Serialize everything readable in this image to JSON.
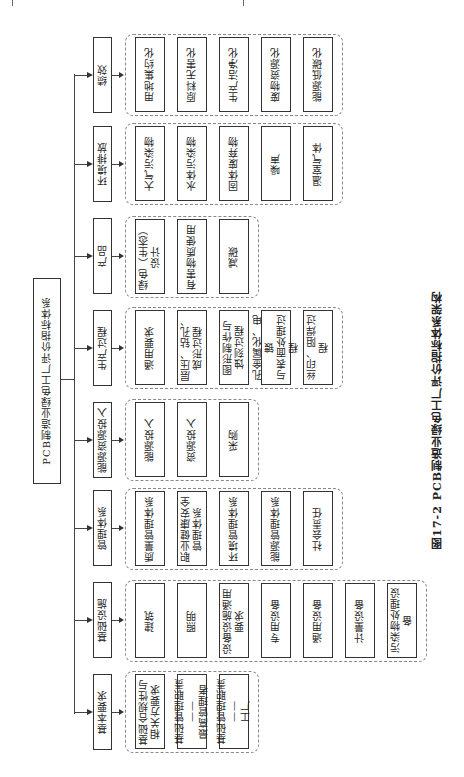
{
  "root": {
    "label": "PCB制造业绿色工厂评价指标体系"
  },
  "caption": "图17-2  PCB制造业绿色工厂评价指标体系架构",
  "categories": [
    {
      "label": "绩效",
      "items": [
        "用地集约化",
        "原料无害化",
        "生产洁净化",
        "废物资源化",
        "能源低碳化"
      ]
    },
    {
      "label": "环境排放",
      "items": [
        "大气污染物",
        "水体污染物",
        "固体废弃物",
        "噪声",
        "温室气体"
      ]
    },
    {
      "label": "产品",
      "items": [
        "绿色（生态）\n设计",
        "有害物质使用",
        "减碳"
      ]
    },
    {
      "label": "生产过程",
      "items": [
        "通用要求",
        "层压、钻孔、\n成形过程",
        "图形制作与\n蚀刻过程",
        "孔金属化、电镀\n与表面处理过程",
        "丝印、阻焊过程"
      ]
    },
    {
      "label": "能源资源投入",
      "items": [
        "能源投入",
        "资源投入",
        "采购"
      ]
    },
    {
      "label": "管理体系",
      "items": [
        "质量管理体系",
        "职业健康安全\n管理体系",
        "环境管理体系",
        "能源管理体系",
        "社会责任"
      ]
    },
    {
      "label": "基础设施",
      "items": [
        "建筑",
        "照明",
        "设备设施通用\n要求",
        "专用设备",
        "通用设备",
        "计量设备",
        "污染物处理设备"
      ]
    },
    {
      "label": "基本要求",
      "items": [
        "基础合规性与\n相关方要求",
        "基础管理职责——\n最高管理者",
        "基础管理职责——\n工厂"
      ]
    }
  ],
  "colors": {
    "line": "#333333",
    "dashed_border": "#888888",
    "background": "#ffffff"
  }
}
